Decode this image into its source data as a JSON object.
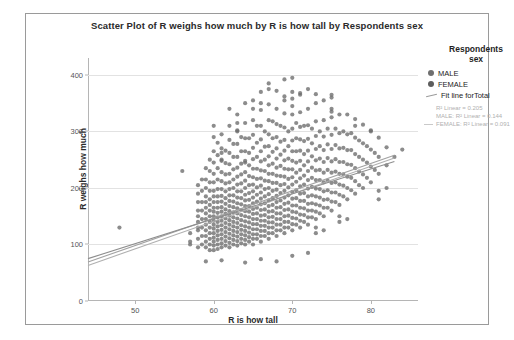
{
  "chart_data": {
    "type": "scatter",
    "title": "Scatter Plot of R weighs how much by R is how tall by Respondents sex",
    "xlabel": "R is how tall",
    "ylabel": "R weighs how much",
    "xlim": [
      44,
      86
    ],
    "ylim": [
      0,
      430
    ],
    "xticks": [
      50,
      60,
      70,
      80
    ],
    "yticks": [
      0,
      100,
      200,
      300,
      400
    ],
    "grid": true,
    "legend_position": "right",
    "legend": {
      "title_line1": "Respondents",
      "title_line2": "sex",
      "entries": [
        {
          "label": "MALE",
          "marker": "circle",
          "color": "#6f6f6f"
        },
        {
          "label": "FEMALE",
          "marker": "circle",
          "color": "#5d5d5d"
        },
        {
          "label": "Fit line forTotal",
          "marker": "line",
          "color": "#9b9b9b"
        }
      ],
      "stats": [
        {
          "text": "R² Linear = 0.205",
          "has_line": false
        },
        {
          "text": "MALE: R² Linear = 0.144",
          "has_line": false
        },
        {
          "text": "FEMALE: R² Linear = 0.091",
          "has_line": true
        }
      ]
    },
    "fit_lines": [
      {
        "name": "Total",
        "x0": 44,
        "y0": 63,
        "x1": 83,
        "y1": 253,
        "color": "#b0b0b0"
      },
      {
        "name": "MALE",
        "x0": 44,
        "y0": 69,
        "x1": 83,
        "y1": 258,
        "color": "#a2a2a2"
      },
      {
        "name": "FEMALE",
        "x0": 44,
        "y0": 75,
        "x1": 83,
        "y1": 247,
        "color": "#8e8e8e"
      }
    ],
    "point_color": "#6b6b6b",
    "columns": [
      {
        "x": 48,
        "values": [
          130
        ]
      },
      {
        "x": 56,
        "values": [
          230
        ]
      },
      {
        "x": 57,
        "values": [
          105,
          120
        ]
      },
      {
        "x": 58,
        "values": [
          95,
          110,
          125,
          130,
          140,
          150,
          160,
          175,
          190,
          205
        ]
      },
      {
        "x": 58.5,
        "values": [
          100,
          115,
          130,
          145,
          160,
          175,
          195,
          215
        ]
      },
      {
        "x": 59,
        "values": [
          95,
          105,
          115,
          125,
          135,
          145,
          155,
          165,
          175,
          185,
          200,
          215,
          235
        ]
      },
      {
        "x": 59.5,
        "values": [
          90,
          100,
          110,
          120,
          130,
          140,
          150,
          160,
          170,
          180,
          195,
          210,
          230,
          250
        ]
      },
      {
        "x": 60,
        "values": [
          90,
          98,
          105,
          112,
          120,
          128,
          135,
          142,
          150,
          158,
          165,
          175,
          185,
          195,
          210,
          225,
          245,
          265,
          290,
          310
        ]
      },
      {
        "x": 60.5,
        "values": [
          92,
          100,
          108,
          116,
          124,
          132,
          140,
          148,
          156,
          165,
          175,
          185,
          198,
          215,
          235,
          258,
          280
        ]
      },
      {
        "x": 61,
        "values": [
          95,
          102,
          110,
          118,
          126,
          134,
          142,
          150,
          158,
          166,
          176,
          186,
          198,
          212,
          228,
          248,
          270,
          295
        ]
      },
      {
        "x": 61.5,
        "values": [
          98,
          106,
          114,
          122,
          130,
          138,
          146,
          154,
          162,
          172,
          182,
          194,
          208,
          224,
          244,
          266
        ]
      },
      {
        "x": 62,
        "values": [
          95,
          103,
          111,
          119,
          127,
          135,
          143,
          151,
          159,
          168,
          177,
          187,
          198,
          210,
          225,
          242,
          262,
          285,
          310,
          340
        ]
      },
      {
        "x": 62.5,
        "values": [
          100,
          108,
          116,
          124,
          132,
          140,
          148,
          157,
          166,
          176,
          187,
          200,
          215,
          233,
          255,
          278
        ]
      },
      {
        "x": 63,
        "values": [
          98,
          106,
          114,
          122,
          130,
          138,
          146,
          155,
          164,
          173,
          183,
          194,
          206,
          220,
          236,
          255,
          278,
          302,
          330
        ]
      },
      {
        "x": 63.5,
        "values": [
          102,
          110,
          118,
          126,
          134,
          143,
          152,
          161,
          171,
          182,
          194,
          208,
          224,
          243,
          265,
          290
        ]
      },
      {
        "x": 64,
        "values": [
          100,
          108,
          116,
          124,
          132,
          141,
          150,
          159,
          168,
          178,
          188,
          200,
          213,
          228,
          245,
          265,
          288,
          315,
          350
        ]
      },
      {
        "x": 64.5,
        "values": [
          105,
          113,
          121,
          130,
          139,
          148,
          158,
          168,
          179,
          191,
          205,
          221,
          240,
          262,
          288
        ]
      },
      {
        "x": 65,
        "values": [
          100,
          110,
          118,
          127,
          136,
          145,
          154,
          163,
          173,
          183,
          194,
          206,
          219,
          234,
          251,
          271,
          294,
          320,
          355
        ]
      },
      {
        "x": 65.5,
        "values": [
          110,
          118,
          127,
          136,
          145,
          155,
          165,
          176,
          188,
          201,
          216,
          234,
          255,
          280,
          310
        ]
      },
      {
        "x": 66,
        "values": [
          105,
          115,
          124,
          133,
          142,
          151,
          161,
          171,
          181,
          192,
          204,
          217,
          231,
          247,
          265,
          286,
          310,
          338,
          370
        ]
      },
      {
        "x": 66.5,
        "values": [
          115,
          124,
          133,
          142,
          152,
          162,
          173,
          185,
          198,
          213,
          230,
          250,
          273,
          300
        ]
      },
      {
        "x": 67,
        "values": [
          110,
          120,
          130,
          139,
          148,
          158,
          168,
          178,
          189,
          200,
          212,
          225,
          240,
          256,
          274,
          295,
          320,
          348,
          385
        ]
      },
      {
        "x": 67.5,
        "values": [
          120,
          130,
          139,
          149,
          159,
          170,
          182,
          195,
          209,
          225,
          243,
          264,
          288,
          318
        ]
      },
      {
        "x": 68,
        "values": [
          115,
          125,
          135,
          145,
          155,
          165,
          175,
          186,
          197,
          209,
          222,
          236,
          252,
          270,
          290,
          313,
          340,
          372
        ]
      },
      {
        "x": 68.5,
        "values": [
          125,
          135,
          145,
          155,
          166,
          178,
          191,
          205,
          221,
          239,
          259,
          282,
          310
        ]
      },
      {
        "x": 69,
        "values": [
          120,
          130,
          140,
          150,
          161,
          172,
          183,
          195,
          207,
          220,
          234,
          249,
          266,
          285,
          307,
          332,
          362
        ]
      },
      {
        "x": 69.5,
        "values": [
          130,
          140,
          151,
          162,
          174,
          187,
          201,
          216,
          233,
          252,
          274,
          300
        ]
      },
      {
        "x": 70,
        "values": [
          125,
          136,
          147,
          158,
          169,
          181,
          193,
          206,
          219,
          233,
          248,
          265,
          284,
          305,
          330,
          358,
          395
        ]
      },
      {
        "x": 70.5,
        "values": [
          135,
          146,
          157,
          169,
          182,
          196,
          211,
          227,
          245,
          265,
          288,
          315
        ]
      },
      {
        "x": 71,
        "values": [
          130,
          142,
          153,
          165,
          177,
          190,
          203,
          217,
          232,
          248,
          266,
          286,
          308,
          334,
          365
        ]
      },
      {
        "x": 71.5,
        "values": [
          140,
          152,
          164,
          177,
          191,
          206,
          222,
          240,
          260,
          283,
          310
        ]
      },
      {
        "x": 72,
        "values": [
          135,
          148,
          160,
          172,
          185,
          199,
          214,
          230,
          247,
          266,
          287,
          311,
          340,
          375
        ]
      },
      {
        "x": 72.5,
        "values": [
          148,
          160,
          173,
          187,
          202,
          218,
          236,
          256,
          279,
          305
        ]
      },
      {
        "x": 73,
        "values": [
          145,
          158,
          171,
          185,
          199,
          214,
          231,
          249,
          269,
          292,
          318,
          350
        ]
      },
      {
        "x": 73.5,
        "values": [
          155,
          169,
          183,
          198,
          214,
          232,
          252,
          274,
          300
        ]
      },
      {
        "x": 74,
        "values": [
          150,
          165,
          179,
          194,
          210,
          227,
          246,
          267,
          291,
          320,
          355
        ]
      },
      {
        "x": 74.5,
        "values": [
          165,
          180,
          196,
          213,
          232,
          253,
          277,
          305
        ]
      },
      {
        "x": 75,
        "values": [
          160,
          176,
          192,
          209,
          227,
          247,
          269,
          294,
          325,
          365
        ]
      },
      {
        "x": 75.5,
        "values": [
          175,
          192,
          210,
          229,
          251,
          276,
          305
        ]
      },
      {
        "x": 76,
        "values": [
          170,
          188,
          206,
          225,
          246,
          270,
          297,
          330
        ]
      },
      {
        "x": 76.5,
        "values": [
          185,
          204,
          224,
          246,
          271,
          300
        ]
      },
      {
        "x": 77,
        "values": [
          180,
          200,
          220,
          242,
          267,
          295,
          330
        ]
      },
      {
        "x": 77.5,
        "values": [
          196,
          218,
          241,
          267,
          297
        ]
      },
      {
        "x": 78,
        "values": [
          190,
          212,
          235,
          260,
          289,
          322
        ]
      },
      {
        "x": 78.5,
        "values": [
          205,
          229,
          255,
          284
        ]
      },
      {
        "x": 79,
        "values": [
          200,
          224,
          250,
          279,
          312
        ]
      },
      {
        "x": 79.5,
        "values": [
          218,
          245,
          274
        ]
      },
      {
        "x": 80,
        "values": [
          210,
          238,
          268,
          302
        ]
      },
      {
        "x": 80.5,
        "values": [
          232,
          262
        ]
      },
      {
        "x": 81,
        "values": [
          225,
          255,
          289
        ]
      },
      {
        "x": 82,
        "values": [
          240,
          272
        ]
      },
      {
        "x": 83,
        "values": [
          255
        ]
      },
      {
        "x": 84,
        "values": [
          268
        ]
      },
      {
        "x": 63,
        "values": [
          300,
          315
        ]
      },
      {
        "x": 65,
        "values": [
          340
        ]
      },
      {
        "x": 66,
        "values": [
          350
        ]
      },
      {
        "x": 67,
        "values": [
          375
        ]
      },
      {
        "x": 69,
        "values": [
          392,
          355
        ]
      },
      {
        "x": 70,
        "values": [
          370,
          345
        ]
      },
      {
        "x": 71,
        "values": [
          368
        ]
      },
      {
        "x": 73,
        "values": [
          366
        ]
      },
      {
        "x": 75,
        "values": [
          360,
          340,
          335
        ]
      },
      {
        "x": 78,
        "values": [
          310
        ]
      },
      {
        "x": 80,
        "values": [
          300
        ]
      },
      {
        "x": 57,
        "values": [
          100
        ]
      },
      {
        "x": 59,
        "values": [
          70
        ]
      },
      {
        "x": 61,
        "values": [
          72
        ]
      },
      {
        "x": 64,
        "values": [
          68
        ]
      },
      {
        "x": 66,
        "values": [
          74
        ]
      },
      {
        "x": 68,
        "values": [
          70
        ]
      },
      {
        "x": 70,
        "values": [
          80
        ]
      },
      {
        "x": 72,
        "values": [
          85
        ]
      },
      {
        "x": 61,
        "values": [
          250,
          262
        ]
      },
      {
        "x": 64,
        "values": [
          248
        ]
      },
      {
        "x": 73,
        "values": [
          130,
          120
        ]
      },
      {
        "x": 74,
        "values": [
          125
        ]
      },
      {
        "x": 76,
        "values": [
          140,
          150
        ]
      },
      {
        "x": 77,
        "values": [
          145
        ]
      },
      {
        "x": 81,
        "values": [
          180,
          195
        ]
      },
      {
        "x": 82,
        "values": [
          200
        ]
      }
    ]
  }
}
